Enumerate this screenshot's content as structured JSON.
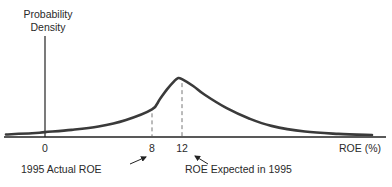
{
  "chart_data": {
    "type": "line",
    "title": "",
    "ylabel": "Probability Density",
    "xlabel": "ROE (%)",
    "grid": false,
    "legend": "none",
    "y_is_schematic": true,
    "x_ticks": [
      {
        "value": 0,
        "label": "0"
      },
      {
        "value": 8,
        "label": "8"
      },
      {
        "value": 12,
        "label": "12"
      }
    ],
    "series": [
      {
        "name": "ROE probability density (schematic)",
        "x": [
          -3,
          -1,
          0,
          2,
          4,
          6,
          8,
          9,
          10,
          11,
          11.5,
          12,
          13,
          14,
          16,
          18,
          20,
          23,
          26,
          29
        ],
        "y": [
          0.01,
          0.03,
          0.05,
          0.09,
          0.15,
          0.26,
          0.45,
          0.62,
          0.8,
          0.95,
          1.0,
          0.98,
          0.86,
          0.71,
          0.47,
          0.29,
          0.16,
          0.06,
          0.02,
          0.0
        ]
      }
    ],
    "reference_lines": [
      {
        "x": 8,
        "style": "dashed",
        "annotation": "1995 Actual ROE"
      },
      {
        "x": 12,
        "style": "dashed",
        "annotation": "ROE Expected in 1995"
      }
    ]
  },
  "labels": {
    "ylabel_line1": "Probability",
    "ylabel_line2": "Density",
    "xlabel": "ROE (%)",
    "annotation_actual": "1995 Actual ROE",
    "annotation_expected": "ROE Expected in 1995"
  },
  "colors": {
    "curve": "#3a3a3a",
    "axis": "#222222",
    "dash": "#777777"
  }
}
